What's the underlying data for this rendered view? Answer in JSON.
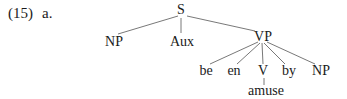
{
  "example": {
    "number": "(15)",
    "sub": "a."
  },
  "tree": {
    "root": "S",
    "np": "NP",
    "aux": "Aux",
    "vp": "VP",
    "vp_children": [
      "be",
      "en",
      "V",
      "by",
      "NP"
    ],
    "v_child": "amuse"
  }
}
